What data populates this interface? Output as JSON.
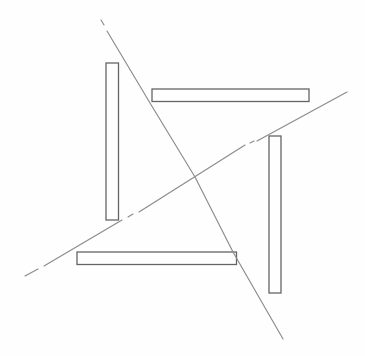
{
  "canvas": {
    "width": 365,
    "height": 356,
    "background": "#fefefe"
  },
  "figure": {
    "style": {
      "bar_stroke_color": "#646464",
      "bar_stroke_width": 1.3,
      "line_stroke_color": "#8b8b8b",
      "line_stroke_width": 1.15,
      "fill": "none"
    },
    "bars": [
      {
        "name": "bar-left-vertical",
        "x": 106,
        "y": 63,
        "width": 12.5,
        "height": 157
      },
      {
        "name": "bar-top-horizontal",
        "x": 152,
        "y": 89,
        "width": 157,
        "height": 12.5
      },
      {
        "name": "bar-right-vertical",
        "x": 269,
        "y": 136,
        "width": 12,
        "height": 157
      },
      {
        "name": "bar-bottom-horizontal",
        "x": 77,
        "y": 252,
        "width": 159.5,
        "height": 12.5
      }
    ],
    "lines": [
      {
        "name": "diagonal-line-steep",
        "segments": [
          [
            [
              101,
              20
            ],
            [
              104,
              25
            ]
          ],
          [
            [
              107,
              31
            ],
            [
              150,
              103
            ],
            [
              195,
              177
            ],
            [
              233,
              252
            ],
            [
              283,
              339
            ]
          ]
        ]
      },
      {
        "name": "diagonal-line-shallow",
        "segments": [
          [
            [
              25,
              276
            ],
            [
              38,
              269
            ]
          ],
          [
            [
              44,
              266
            ],
            [
              122,
              220
            ]
          ],
          [
            [
              128,
              217
            ],
            [
              133,
              214
            ]
          ],
          [
            [
              139,
              212
            ],
            [
              245,
              145
            ]
          ],
          [
            [
              250,
              143
            ],
            [
              254,
              141
            ]
          ],
          [
            [
              257,
              141
            ],
            [
              347,
              92
            ]
          ]
        ]
      }
    ]
  }
}
